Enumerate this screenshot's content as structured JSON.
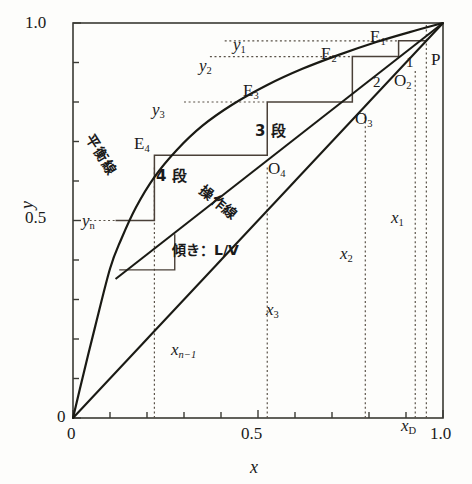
{
  "figure": {
    "kind": "mccabe-thiele-stage-diagram",
    "axes": {
      "x_label": "x",
      "y_label": "y",
      "x_ticklabels": [
        "0",
        "0.5",
        "1.0"
      ],
      "y_ticklabels": [
        "0",
        "0.5",
        "1.0"
      ],
      "x_tick_values": [
        0,
        0.5,
        1.0
      ],
      "y_tick_values": [
        0,
        0.5,
        1.0
      ],
      "minor_tick_step": 0.1,
      "xlim": [
        0,
        1.0
      ],
      "ylim": [
        0,
        1.0
      ],
      "grid": false,
      "frame_color": "#3a3a34"
    },
    "curve_labels": {
      "equilibrium": "平衡線",
      "operating": "操作線",
      "slope": "傾き：L/V"
    },
    "stage_labels": [
      {
        "text": "3 段",
        "x": 0.6,
        "y": 0.735
      },
      {
        "text": "4 段",
        "x": 0.335,
        "y": 0.595
      }
    ],
    "stage_numbers": [
      {
        "text": "1",
        "x": 0.905,
        "y": 0.912
      },
      {
        "text": "2",
        "x": 0.835,
        "y": 0.868
      }
    ],
    "point_labels": [
      {
        "name": "P",
        "text": "P",
        "x": 0.975,
        "y": 0.905
      },
      {
        "name": "E1",
        "text": "E",
        "sub": "1",
        "x": 0.88,
        "y": 0.975
      },
      {
        "name": "E2",
        "text": "E",
        "sub": "2",
        "x": 0.74,
        "y": 0.935
      },
      {
        "name": "E3",
        "text": "E",
        "sub": "3",
        "x": 0.505,
        "y": 0.825
      },
      {
        "name": "E4",
        "text": "E",
        "sub": "4",
        "x": 0.2,
        "y": 0.69
      },
      {
        "name": "O2",
        "text": "O",
        "sub": "2",
        "x": 0.93,
        "y": 0.88
      },
      {
        "name": "O3",
        "text": "O",
        "sub": "3",
        "x": 0.8,
        "y": 0.768
      },
      {
        "name": "O4",
        "text": "O",
        "sub": "4",
        "x": 0.535,
        "y": 0.63
      }
    ],
    "y_value_labels": [
      {
        "name": "y1",
        "text": "y",
        "sub": "1",
        "value": 0.955
      },
      {
        "name": "y2",
        "text": "y",
        "sub": "2",
        "value": 0.915
      },
      {
        "name": "y3",
        "text": "y",
        "sub": "3",
        "value": 0.8
      },
      {
        "name": "yn",
        "text": "y",
        "sub": "n",
        "value": 0.5
      }
    ],
    "x_value_labels": [
      {
        "name": "x1",
        "text": "x",
        "sub": "1",
        "value": 0.925
      },
      {
        "name": "x2",
        "text": "x",
        "sub": "2",
        "value": 0.79
      },
      {
        "name": "x3",
        "text": "x",
        "sub": "3",
        "value": 0.525
      },
      {
        "name": "xn1",
        "text": "x",
        "sub": "n−1",
        "value": 0.22
      },
      {
        "name": "xD",
        "text": "x",
        "sub": "D",
        "value": 0.955
      }
    ]
  },
  "chart_data": {
    "type": "line",
    "title": "",
    "xlabel": "x",
    "ylabel": "y",
    "xlim": [
      0,
      1.0
    ],
    "ylim": [
      0,
      1.0
    ],
    "grid": false,
    "legend": "none",
    "series": [
      {
        "name": "diagonal",
        "label": "y = x",
        "color": "#1a1a14",
        "points": [
          [
            0,
            0
          ],
          [
            1.0,
            1.0
          ]
        ]
      },
      {
        "name": "equilibrium-curve",
        "label": "平衡線",
        "color": "#1a1a14",
        "points": [
          [
            0.0,
            0.0
          ],
          [
            0.03,
            0.118
          ],
          [
            0.06,
            0.232
          ],
          [
            0.1,
            0.378
          ],
          [
            0.13,
            0.452
          ],
          [
            0.17,
            0.533
          ],
          [
            0.22,
            0.61
          ],
          [
            0.28,
            0.678
          ],
          [
            0.35,
            0.74
          ],
          [
            0.43,
            0.793
          ],
          [
            0.525,
            0.843
          ],
          [
            0.62,
            0.884
          ],
          [
            0.72,
            0.92
          ],
          [
            0.82,
            0.952
          ],
          [
            0.91,
            0.977
          ],
          [
            1.0,
            1.0
          ]
        ]
      },
      {
        "name": "operating-line",
        "label": "操作線",
        "color": "#1a1a14",
        "points": [
          [
            0.115,
            0.352
          ],
          [
            1.0,
            1.0
          ]
        ],
        "slope_label": "傾き：L/V"
      }
    ],
    "staircase": {
      "name": "stage-staircase",
      "color": "#4a4038",
      "vertices": [
        [
          0.955,
          0.955
        ],
        [
          0.88,
          0.955
        ],
        [
          0.88,
          0.915
        ],
        [
          0.755,
          0.915
        ],
        [
          0.755,
          0.8
        ],
        [
          0.525,
          0.8
        ],
        [
          0.525,
          0.665
        ],
        [
          0.22,
          0.665
        ],
        [
          0.22,
          0.5
        ],
        [
          0.115,
          0.5
        ]
      ],
      "equilibrium_points": [
        {
          "name": "E1",
          "x": 0.88,
          "y": 0.955
        },
        {
          "name": "E2",
          "x": 0.755,
          "y": 0.915
        },
        {
          "name": "E3",
          "x": 0.525,
          "y": 0.8
        },
        {
          "name": "E4",
          "x": 0.22,
          "y": 0.665
        }
      ],
      "operating_points": [
        {
          "name": "O2",
          "x": 0.925,
          "y": 0.915
        },
        {
          "name": "O3",
          "x": 0.79,
          "y": 0.8
        },
        {
          "name": "O4",
          "x": 0.525,
          "y": 0.665
        }
      ],
      "top_point": {
        "name": "P",
        "x": 1.0,
        "y": 1.0
      },
      "stage_count_visible": 4
    },
    "slope_triangle": {
      "name": "slope-triangle",
      "vertices": [
        [
          0.125,
          0.375
        ],
        [
          0.275,
          0.375
        ],
        [
          0.275,
          0.465
        ]
      ],
      "label": "傾き：L/V"
    },
    "guide_lines": {
      "horizontal_dotted": [
        {
          "label": "y1",
          "y": 0.955,
          "from_x": 0.41,
          "to_x": 0.88
        },
        {
          "label": "y2",
          "y": 0.915,
          "from_x": 0.37,
          "to_x": 0.755
        },
        {
          "label": "y3",
          "y": 0.8,
          "from_x": 0.3,
          "to_x": 0.525
        },
        {
          "label": "yn",
          "y": 0.5,
          "from_x": 0.045,
          "to_x": 0.22
        }
      ],
      "vertical_dotted": [
        {
          "label": "x1",
          "x": 0.925,
          "from_y": 0.0,
          "to_y": 0.88
        },
        {
          "label": "x2",
          "x": 0.79,
          "from_y": 0.0,
          "to_y": 0.77
        },
        {
          "label": "x3",
          "x": 0.525,
          "from_y": 0.0,
          "to_y": 0.64
        },
        {
          "label": "xn1",
          "x": 0.22,
          "from_y": 0.0,
          "to_y": 0.64
        },
        {
          "label": "xD",
          "x": 0.955,
          "from_y": 0.0,
          "to_y": 1.0
        }
      ]
    }
  }
}
